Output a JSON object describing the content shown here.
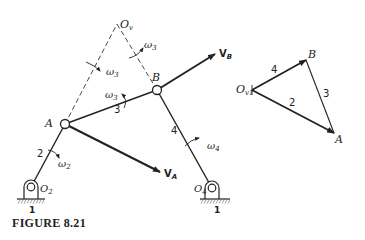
{
  "figure": {
    "caption": "FIGURE 8.21",
    "mechanism": {
      "points": {
        "Ov": {
          "label": "O",
          "sub": "v"
        },
        "A": {
          "label": "A"
        },
        "B": {
          "label": "B"
        },
        "O2": {
          "label": "O",
          "sub": "2"
        },
        "O4": {
          "label": "O",
          "sub": "4"
        }
      },
      "links": [
        {
          "id": "2",
          "label": "2",
          "from": "O2",
          "to": "A"
        },
        {
          "id": "3",
          "label": "3",
          "from": "A",
          "to": "B"
        },
        {
          "id": "4",
          "label": "4",
          "from": "B",
          "to": "O4"
        }
      ],
      "ground_labels": [
        "1",
        "1"
      ],
      "angular_velocities": [
        {
          "symbol": "ω",
          "sub": "2"
        },
        {
          "symbol": "ω",
          "sub": "3"
        },
        {
          "symbol": "ω",
          "sub": "3"
        },
        {
          "symbol": "ω",
          "sub": "3"
        },
        {
          "symbol": "ω",
          "sub": "4"
        }
      ],
      "velocity_vectors": [
        {
          "symbol": "V",
          "sub": "B"
        },
        {
          "symbol": "V",
          "sub": "A"
        }
      ]
    },
    "velocity_polygon": {
      "origin": {
        "label": "O",
        "sub": "v1"
      },
      "vertices": [
        "B",
        "A"
      ],
      "sides": [
        {
          "label": "4",
          "from": "Ov1",
          "to": "B"
        },
        {
          "label": "2",
          "from": "Ov1",
          "to": "A"
        },
        {
          "label": "3",
          "from": "B",
          "to": "A"
        }
      ]
    }
  }
}
